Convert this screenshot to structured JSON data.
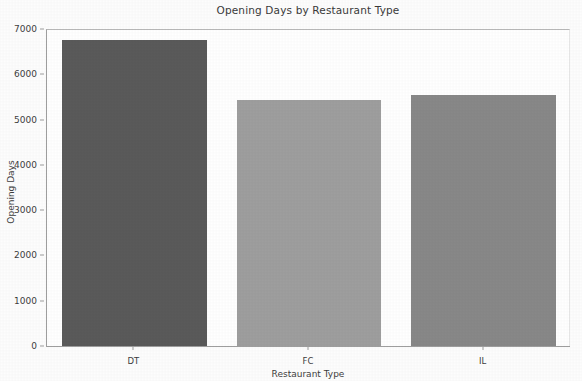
{
  "chart_data": {
    "type": "bar",
    "title": "Opening Days by Restaurant Type",
    "xlabel": "Restaurant Type",
    "ylabel": "Opening Days",
    "categories": [
      "DT",
      "FC",
      "IL"
    ],
    "values": [
      6760,
      5430,
      5540
    ],
    "series": [
      {
        "name": "Opening Days",
        "values": [
          6760,
          5430,
          5540
        ]
      }
    ],
    "ylim": [
      0,
      7000
    ],
    "yticks": [
      0,
      1000,
      2000,
      3000,
      4000,
      5000,
      6000,
      7000
    ],
    "ytick_labels": [
      "0",
      "1000",
      "2000",
      "3000",
      "4000",
      "5000",
      "6000",
      "7000"
    ],
    "xtick_labels": [
      "DT",
      "FC",
      "IL"
    ],
    "grid": false,
    "legend": "none",
    "bar_colors": [
      "#5a5a5a",
      "#9e9e9e",
      "#888888"
    ],
    "background_color": "#ffffff",
    "axis_color": "#9e9e9e",
    "text_color": "#3d3d3d"
  }
}
